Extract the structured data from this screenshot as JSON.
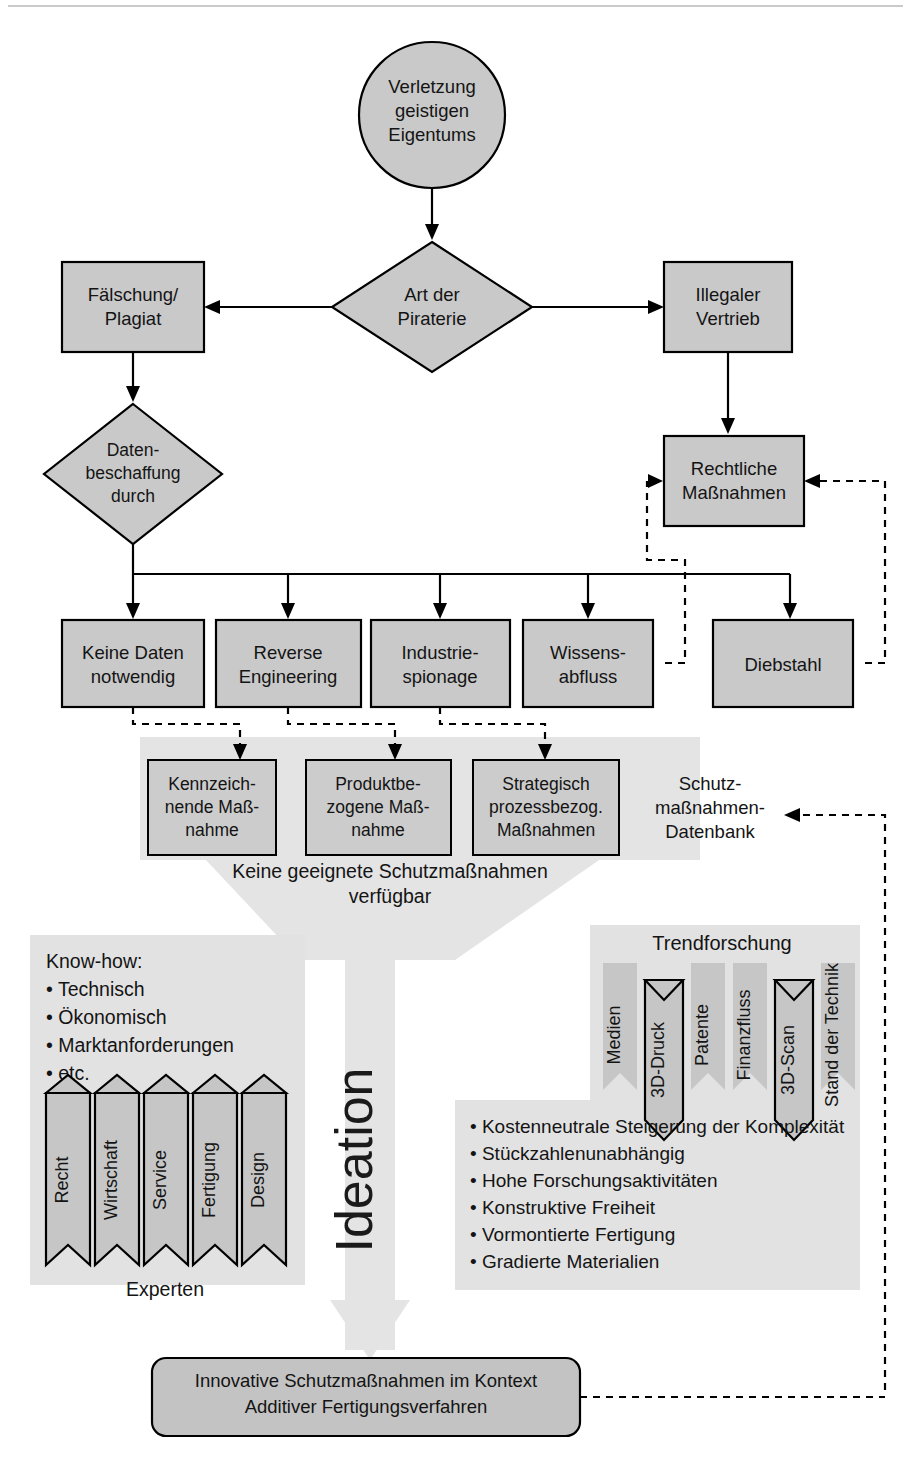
{
  "figure": {
    "title_circle": {
      "lines": [
        "Verletzung",
        "geistigen",
        "Eigentums"
      ]
    },
    "decision_piracy": {
      "lines": [
        "Art der",
        "Piraterie"
      ]
    },
    "box_counterfeit": {
      "lines": [
        "Fälschung/",
        "Plagiat"
      ]
    },
    "box_illegal_distribution": {
      "lines": [
        "Illegaler",
        "Vertrieb"
      ]
    },
    "decision_data_acquisition": {
      "lines": [
        "Daten-",
        "beschaffung",
        "durch"
      ]
    },
    "box_legal_measures": {
      "lines": [
        "Rechtliche",
        "Maßnahmen"
      ]
    },
    "acquisition_boxes": [
      {
        "name": "keine-daten-notwendig",
        "lines": [
          "Keine Daten",
          "notwendig"
        ]
      },
      {
        "name": "reverse-engineering",
        "lines": [
          "Reverse",
          "Engineering"
        ]
      },
      {
        "name": "industriespionage",
        "lines": [
          "Industrie-",
          "spionage"
        ]
      },
      {
        "name": "wissensabfluss",
        "lines": [
          "Wissens-",
          "abfluss"
        ]
      },
      {
        "name": "diebstahl",
        "lines": [
          "Diebstahl"
        ]
      }
    ],
    "measure_boxes": [
      {
        "name": "kennzeichnende-massnahme",
        "lines": [
          "Kennzeich-",
          "nende Maß-",
          "nahme"
        ]
      },
      {
        "name": "produktbezogene-massnahme",
        "lines": [
          "Produktbe-",
          "zogene Maß-",
          "nahme"
        ]
      },
      {
        "name": "strategisch-prozessbezogene-massnahmen",
        "lines": [
          "Strategisch",
          "prozessbezog.",
          "Maßnahmen"
        ]
      }
    ],
    "database_label": {
      "lines": [
        "Schutz-",
        "maßnahmen-",
        "Datenbank"
      ]
    },
    "funnel_caption": {
      "lines": [
        "Keine geeignete Schutzmaßnahmen",
        "verfügbar"
      ]
    },
    "ideation_label": "Ideation",
    "knowhow": {
      "heading": "Know-how:",
      "items": [
        "Technisch",
        "Ökonomisch",
        "Marktanforderungen",
        "etc."
      ]
    },
    "experten": {
      "caption": "Experten",
      "banners": [
        "Recht",
        "Wirtschaft",
        "Service",
        "Fertigung",
        "Design"
      ]
    },
    "trendforschung": {
      "caption": "Trendforschung",
      "banners": [
        {
          "label": "Medien",
          "highlighted": false
        },
        {
          "label": "3D-Druck",
          "highlighted": true
        },
        {
          "label": "Patente",
          "highlighted": false
        },
        {
          "label": "Finanzfluss",
          "highlighted": false
        },
        {
          "label": "3D-Scan",
          "highlighted": true
        },
        {
          "label": "Stand der Technik",
          "highlighted": false
        }
      ]
    },
    "benefits": [
      "Kostenneutrale Steigerung der Komplexität",
      "Stückzahlenunabhängig",
      "Hohe Forschungsaktivitäten",
      "Konstruktive Freiheit",
      "Vormontierte Fertigung",
      "Gradierte Materialien"
    ],
    "outcome_box": {
      "lines": [
        "Innovative Schutzmaßnahmen im Kontext",
        "Additiver Fertigungsverfahren"
      ]
    },
    "colors": {
      "node_fill": "#c9c9c9",
      "panel_fill": "#dcdcdc",
      "funnel_fill": "#e4e4e4",
      "banner_fill": "#c6c6c6",
      "line": "#000000",
      "text": "#141414"
    }
  }
}
